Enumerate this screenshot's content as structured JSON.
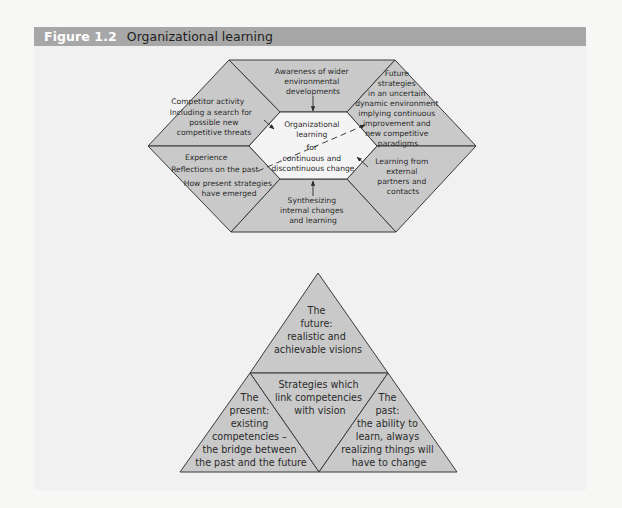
{
  "figure": {
    "number": "Figure 1.2",
    "title": "Organizational learning"
  },
  "colors": {
    "header_bg": "#a7a7a7",
    "panel_bg": "#f1f1f1",
    "shape_fill": "#c9c9c9",
    "inner_fill": "#f4f4f4",
    "stroke": "#3a3a3a"
  },
  "hexagon": {
    "center": {
      "lines": [
        "Organizational",
        "learning",
        "for",
        "continuous and",
        "discontinuous change"
      ]
    },
    "segments": {
      "top": {
        "lines": [
          "Awareness of wider",
          "environmental",
          "developments"
        ]
      },
      "top_left": {
        "lines": [
          "Competitor activity",
          "Including a search for",
          "possible new",
          "competitive threats"
        ]
      },
      "top_right": {
        "lines": [
          "Future",
          "strategies",
          "in an uncertain",
          "dynamic environment",
          "implying continuous",
          "improvement and",
          "new competitive",
          "paradigms"
        ]
      },
      "bottom_left": {
        "lines": [
          "Experience",
          "Reflections on the past",
          "How present strategies",
          "have emerged"
        ]
      },
      "bottom": {
        "lines": [
          "Synthesizing",
          "internal changes",
          "and learning"
        ]
      },
      "bottom_right": {
        "lines": [
          "Learning from",
          "external",
          "partners and",
          "contacts"
        ]
      }
    }
  },
  "triangle": {
    "top": {
      "lines": [
        "The",
        "future:",
        "realistic and",
        "achievable visions"
      ]
    },
    "middle": {
      "lines": [
        "Strategies which",
        "link competencies",
        "with vision"
      ]
    },
    "left": {
      "lines": [
        "The",
        "present:",
        "existing",
        "competencies –",
        "the bridge between",
        "the past and the future"
      ]
    },
    "right": {
      "lines": [
        "The",
        "past:",
        "the ability to",
        "learn, always",
        "realizing things will",
        "have to change"
      ]
    }
  }
}
